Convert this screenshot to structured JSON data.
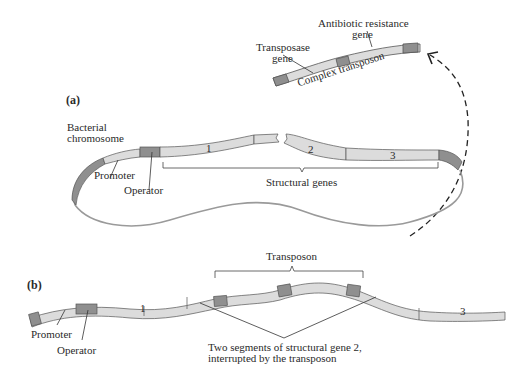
{
  "panel_a": {
    "label": "(a)",
    "transposon": {
      "antibiotic_line1": "Antibiotic resistance",
      "antibiotic_line2": "gene",
      "transposase_line1": "Transposase",
      "transposase_line2": "gene",
      "complex_label": "Complex transposon"
    },
    "chromosome": {
      "label_line1": "Bacterial",
      "label_line2": "chromosome",
      "promoter": "Promoter",
      "operator": "Operator",
      "gene1": "1",
      "gene2": "2",
      "gene3": "3",
      "structural_genes": "Structural genes"
    }
  },
  "panel_b": {
    "label": "(b)",
    "transposon": "Transposon",
    "promoter": "Promoter",
    "operator": "Operator",
    "gene1": "1",
    "gene3": "3",
    "segments_line1": "Two segments of structural gene 2,",
    "segments_line2": "interrupted by the transposon"
  },
  "colors": {
    "gene_fill": "#dcdcdc",
    "dark_fill": "#8f8f8f",
    "outline": "#555555",
    "chromosome_line": "#9a9a9a"
  }
}
